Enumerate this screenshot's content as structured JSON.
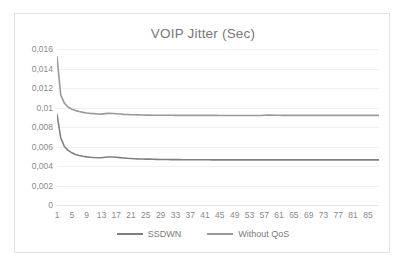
{
  "chart_data": {
    "type": "line",
    "title": "VOIP Jitter (Sec)",
    "xlabel": "",
    "ylabel": "",
    "ylim": [
      0,
      0.016
    ],
    "xlim": [
      1,
      88
    ],
    "grid": true,
    "legend_position": "bottom",
    "y_tick_labels": [
      "0,016",
      "0,014",
      "0,012",
      "0,01",
      "0,008",
      "0,006",
      "0,004",
      "0,002",
      "0"
    ],
    "y_tick_values": [
      0.016,
      0.014,
      0.012,
      0.01,
      0.008,
      0.006,
      0.004,
      0.002,
      0
    ],
    "x_tick_labels": [
      "1",
      "5",
      "9",
      "13",
      "17",
      "21",
      "25",
      "29",
      "33",
      "37",
      "41",
      "45",
      "49",
      "53",
      "57",
      "61",
      "65",
      "69",
      "73",
      "77",
      "81",
      "85"
    ],
    "x_tick_values": [
      1,
      5,
      9,
      13,
      17,
      21,
      25,
      29,
      33,
      37,
      41,
      45,
      49,
      53,
      57,
      61,
      65,
      69,
      73,
      77,
      81,
      85
    ],
    "x": [
      1,
      2,
      3,
      4,
      5,
      6,
      7,
      8,
      9,
      10,
      11,
      12,
      13,
      14,
      15,
      16,
      17,
      18,
      19,
      20,
      21,
      22,
      23,
      24,
      25,
      26,
      27,
      28,
      29,
      30,
      31,
      32,
      33,
      34,
      35,
      36,
      37,
      38,
      39,
      40,
      41,
      42,
      43,
      44,
      45,
      46,
      47,
      48,
      49,
      50,
      51,
      52,
      53,
      54,
      55,
      56,
      57,
      58,
      59,
      60,
      61,
      62,
      63,
      64,
      65,
      66,
      67,
      68,
      69,
      70,
      71,
      72,
      73,
      74,
      75,
      76,
      77,
      78,
      79,
      80,
      81,
      82,
      83,
      84,
      85,
      86,
      87,
      88
    ],
    "series": [
      {
        "name": "SSDWN",
        "color": "#808080",
        "values": [
          0.0093,
          0.0069,
          0.006,
          0.0056,
          0.00535,
          0.00518,
          0.00508,
          0.005,
          0.00494,
          0.0049,
          0.00487,
          0.00485,
          0.00484,
          0.00489,
          0.00492,
          0.00493,
          0.0049,
          0.00486,
          0.00482,
          0.00479,
          0.00477,
          0.00475,
          0.00473,
          0.00472,
          0.00471,
          0.0047,
          0.00469,
          0.00468,
          0.00467,
          0.00466,
          0.00466,
          0.00465,
          0.00465,
          0.00465,
          0.00464,
          0.00464,
          0.00464,
          0.00464,
          0.00464,
          0.00464,
          0.00464,
          0.00464,
          0.00463,
          0.00463,
          0.00463,
          0.00463,
          0.00463,
          0.00463,
          0.00463,
          0.00463,
          0.00463,
          0.00463,
          0.00463,
          0.00463,
          0.00463,
          0.00463,
          0.00463,
          0.00463,
          0.00463,
          0.00463,
          0.00463,
          0.00463,
          0.00463,
          0.00463,
          0.00463,
          0.00463,
          0.00463,
          0.00463,
          0.00463,
          0.00463,
          0.00463,
          0.00463,
          0.00463,
          0.00463,
          0.00463,
          0.00463,
          0.00463,
          0.00463,
          0.00463,
          0.00463,
          0.00463,
          0.00463,
          0.00463,
          0.00463,
          0.00463,
          0.00463,
          0.00463,
          0.00463
        ]
      },
      {
        "name": "Without QoS",
        "color": "#9a9a9a",
        "values": [
          0.0152,
          0.0113,
          0.01045,
          0.01005,
          0.00982,
          0.00968,
          0.00958,
          0.0095,
          0.00944,
          0.0094,
          0.00937,
          0.00934,
          0.00932,
          0.00937,
          0.0094,
          0.00939,
          0.00936,
          0.00933,
          0.0093,
          0.00928,
          0.00926,
          0.00925,
          0.00924,
          0.00923,
          0.00922,
          0.00922,
          0.00921,
          0.00921,
          0.0092,
          0.0092,
          0.0092,
          0.0092,
          0.00919,
          0.00919,
          0.00919,
          0.00919,
          0.00919,
          0.00919,
          0.00919,
          0.00919,
          0.00919,
          0.00919,
          0.00919,
          0.00919,
          0.00918,
          0.00918,
          0.00918,
          0.00918,
          0.00918,
          0.00918,
          0.00918,
          0.00918,
          0.00918,
          0.00918,
          0.00918,
          0.00918,
          0.00921,
          0.00922,
          0.00922,
          0.00921,
          0.0092,
          0.00919,
          0.00919,
          0.00919,
          0.00919,
          0.00919,
          0.00919,
          0.00919,
          0.00919,
          0.00919,
          0.00919,
          0.00919,
          0.00919,
          0.00919,
          0.00919,
          0.00919,
          0.00919,
          0.00919,
          0.00919,
          0.00919,
          0.00919,
          0.00919,
          0.00919,
          0.00919,
          0.00919,
          0.00919,
          0.00919,
          0.00919
        ]
      }
    ]
  },
  "legend": {
    "items": [
      {
        "label": "SSDWN",
        "color": "#808080"
      },
      {
        "label": "Without QoS",
        "color": "#9a9a9a"
      }
    ]
  }
}
